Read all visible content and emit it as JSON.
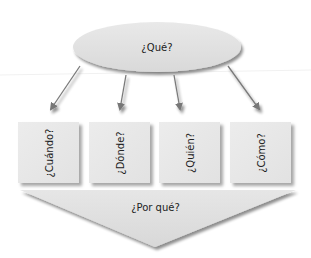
{
  "diagram": {
    "root": {
      "label": "¿Qué?",
      "shape": "ellipse"
    },
    "children": [
      {
        "label": "¿Cuándo?",
        "shape": "square"
      },
      {
        "label": "¿Dónde?",
        "shape": "square"
      },
      {
        "label": "¿Quién?",
        "shape": "square"
      },
      {
        "label": "¿Cómo?",
        "shape": "square"
      }
    ],
    "bottom": {
      "label": "¿Por qué?",
      "shape": "downward-triangle"
    },
    "edges": [
      {
        "from": "¿Qué?",
        "to": "¿Cuándo?"
      },
      {
        "from": "¿Qué?",
        "to": "¿Dónde?"
      },
      {
        "from": "¿Qué?",
        "to": "¿Quién?"
      },
      {
        "from": "¿Qué?",
        "to": "¿Cómo?"
      }
    ]
  },
  "colors": {
    "shape_fill": "#e3e3e3",
    "arrow": "#777777",
    "text": "#222222"
  }
}
